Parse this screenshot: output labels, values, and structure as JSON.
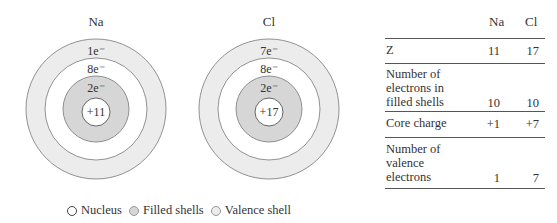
{
  "atoms": [
    {
      "symbol": "Na",
      "nucleus_charge": "+11",
      "shells": [
        "2e⁻",
        "8e⁻",
        "1e⁻"
      ]
    },
    {
      "symbol": "Cl",
      "nucleus_charge": "+17",
      "shells": [
        "2e⁻",
        "8e⁻",
        "7e⁻"
      ]
    }
  ],
  "table": {
    "columns": [
      "Na",
      "Cl"
    ],
    "rows": [
      {
        "label": "Z",
        "values": [
          "11",
          "17"
        ]
      },
      {
        "label": "Number of electrons in filled shells",
        "label_lines": [
          "Number of",
          "electrons in",
          "filled shells"
        ],
        "values": [
          "10",
          "10"
        ]
      },
      {
        "label": "Core charge",
        "values": [
          "+1",
          "+7"
        ]
      },
      {
        "label": "Number of valence electrons",
        "label_lines": [
          "Number of",
          "valence",
          "electrons"
        ],
        "values": [
          "1",
          "7"
        ]
      }
    ]
  },
  "legend": {
    "items": [
      {
        "label": "Nucleus",
        "color": "#ffffff"
      },
      {
        "label": "Filled shells",
        "color": "#d6d6d6"
      },
      {
        "label": "Valence shell",
        "color": "#ececec"
      }
    ]
  },
  "colors": {
    "filled_shell": "#d6d6d6",
    "valence_shell": "#ececec",
    "inner_white": "#ffffff",
    "stroke": "#777777"
  }
}
